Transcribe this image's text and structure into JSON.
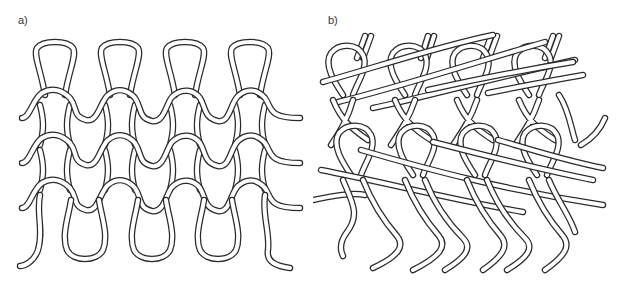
{
  "figure": {
    "panels": [
      {
        "id": "a",
        "label": "a)",
        "description": "Plain weft-knit loop structure, 4 wales x 3 courses of interlocked loops"
      },
      {
        "id": "b",
        "label": "b)",
        "description": "Skewed knit loop structure with diagonal floats, 4 wales"
      }
    ]
  },
  "colors": {
    "yarn_outline": "#2a2a2a",
    "yarn_fill": "#ffffff",
    "background": "#ffffff",
    "label": "#333333"
  }
}
